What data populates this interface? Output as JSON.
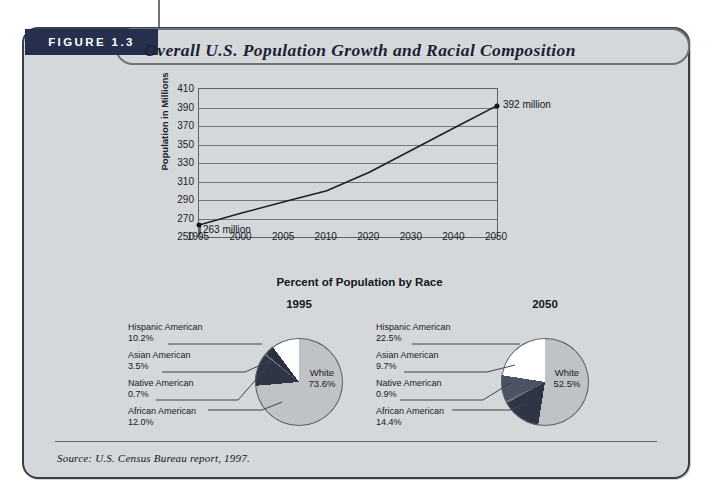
{
  "figure": {
    "badge_label": "FIGURE 1.3",
    "title": "Overall U.S. Population Growth and Racial Composition",
    "source": "Source: U.S. Census Bureau report, 1997.",
    "panel_color": "#d5d8da",
    "badge_color": "#26304e",
    "border_color": "#3a3f46"
  },
  "chart_data": [
    {
      "type": "line",
      "title": "",
      "xlabel": "",
      "ylabel": "Population in Millions",
      "categories": [
        "1995",
        "2000",
        "2005",
        "2010",
        "2020",
        "2030",
        "2040",
        "2050"
      ],
      "values": [
        263,
        276,
        288,
        300,
        320,
        344,
        368,
        392
      ],
      "ylim": [
        250,
        410
      ],
      "yticks": [
        250,
        270,
        290,
        310,
        330,
        350,
        370,
        390,
        410
      ],
      "grid": true,
      "legend": "none",
      "annotations": [
        {
          "point": "1995",
          "text": "263 million",
          "value": 263
        },
        {
          "point": "2050",
          "text": "392 million",
          "value": 392
        }
      ]
    },
    {
      "type": "pie",
      "title": "1995",
      "section_title": "Percent of Population by Race",
      "labels": [
        "White",
        "African American",
        "Native American",
        "Asian American",
        "Hispanic American"
      ],
      "values": [
        73.6,
        12.0,
        0.7,
        3.5,
        10.2
      ],
      "display_values": [
        "73.6%",
        "12.0%",
        "0.7%",
        "3.5%",
        "10.2%"
      ],
      "colors": [
        "#bfc3c6",
        "#2f3545",
        "#6a707a",
        "#2b3040",
        "#ffffff"
      ],
      "center_label": "White",
      "center_value": "73.6%"
    },
    {
      "type": "pie",
      "title": "2050",
      "section_title": "Percent of Population by Race",
      "labels": [
        "White",
        "African American",
        "Native American",
        "Asian American",
        "Hispanic American"
      ],
      "values": [
        52.5,
        14.4,
        0.9,
        9.7,
        22.5
      ],
      "display_values": [
        "52.5%",
        "14.4%",
        "0.9%",
        "9.7%",
        "22.5%"
      ],
      "colors": [
        "#bfc3c6",
        "#2f3545",
        "#6a707a",
        "#4a5263",
        "#ffffff"
      ],
      "center_label": "White",
      "center_value": "52.5%"
    }
  ],
  "line_chart": {
    "ylabel": "Population in Millions",
    "yticks": [
      "410",
      "390",
      "370",
      "350",
      "330",
      "310",
      "290",
      "270",
      "250"
    ],
    "xticks": [
      "1995",
      "2000",
      "2005",
      "2010",
      "2020",
      "2030",
      "2040",
      "2050"
    ],
    "start_callout": "263 million",
    "end_callout": "392 million"
  },
  "pies_section": {
    "title": "Percent of Population by Race",
    "pie_1995": {
      "year": "1995",
      "center_label": "White",
      "center_value": "73.6%",
      "legend": [
        {
          "label": "Hispanic American",
          "value": "10.2%"
        },
        {
          "label": "Asian American",
          "value": "3.5%"
        },
        {
          "label": "Native American",
          "value": "0.7%"
        },
        {
          "label": "African American",
          "value": "12.0%"
        }
      ]
    },
    "pie_2050": {
      "year": "2050",
      "center_label": "White",
      "center_value": "52.5%",
      "legend": [
        {
          "label": "Hispanic American",
          "value": "22.5%"
        },
        {
          "label": "Asian American",
          "value": "9.7%"
        },
        {
          "label": "Native American",
          "value": "0.9%"
        },
        {
          "label": "African American",
          "value": "14.4%"
        }
      ]
    }
  }
}
